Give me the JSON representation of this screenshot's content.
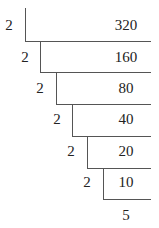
{
  "diagram": {
    "type": "ladder-division",
    "number": "320",
    "steps": [
      {
        "divisor": "2",
        "dividend": "320"
      },
      {
        "divisor": "2",
        "dividend": "160"
      },
      {
        "divisor": "2",
        "dividend": "80"
      },
      {
        "divisor": "2",
        "dividend": "40"
      },
      {
        "divisor": "2",
        "dividend": "20"
      },
      {
        "divisor": "2",
        "dividend": "10"
      }
    ],
    "remainder_quotient": "5"
  }
}
